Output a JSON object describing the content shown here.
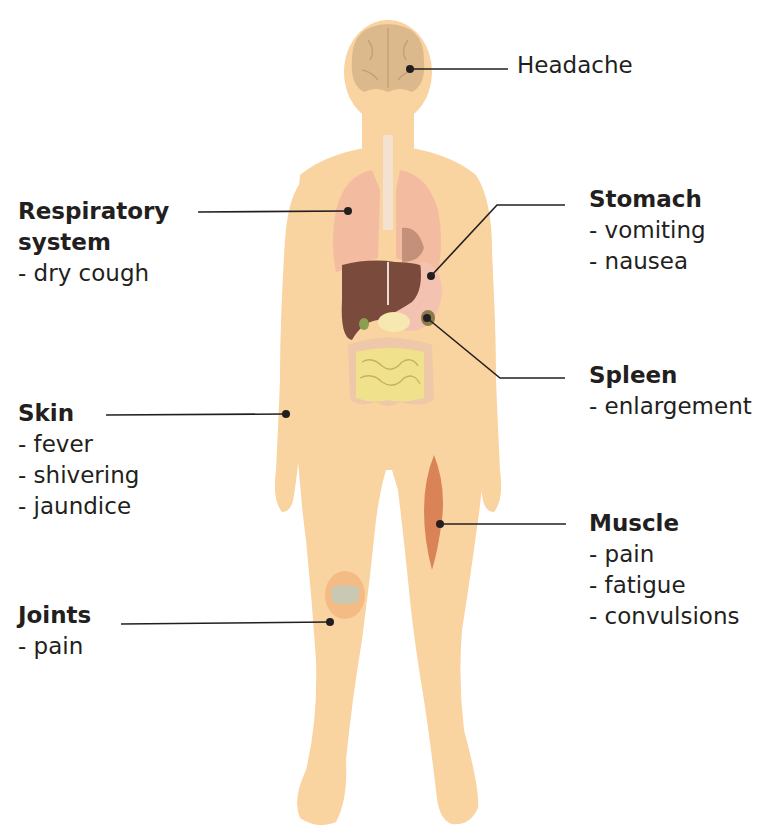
{
  "colors": {
    "skin": "#f9d3a0",
    "lung": "#f2b9a0",
    "liver": "#7a4a3c",
    "stomach": "#f3c2b0",
    "intestine": "#f0e28c",
    "colon": "#efc7a9",
    "muscle": "#d98357",
    "knee": "#c9c8b2",
    "brain": "#dcb98c",
    "leader": "#231f20"
  },
  "labels": [
    {
      "id": "headache",
      "title": "Headache",
      "items": []
    },
    {
      "id": "respiratory",
      "title": "Respiratory",
      "title2": "system",
      "items": [
        "- dry cough"
      ]
    },
    {
      "id": "stomach",
      "title": "Stomach",
      "items": [
        "- vomiting",
        "- nausea"
      ]
    },
    {
      "id": "spleen",
      "title": "Spleen",
      "items": [
        "- enlargement"
      ]
    },
    {
      "id": "skin",
      "title": "Skin",
      "items": [
        "- fever",
        "- shivering",
        "- jaundice"
      ]
    },
    {
      "id": "muscle",
      "title": "Muscle",
      "items": [
        "- pain",
        "- fatigue",
        "- convulsions"
      ]
    },
    {
      "id": "joints",
      "title": "Joints",
      "items": [
        "- pain"
      ]
    }
  ]
}
